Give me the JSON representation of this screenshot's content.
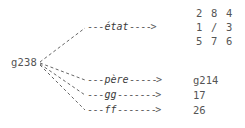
{
  "diagram": {
    "type": "state-node-expansion",
    "background_color": "#ffffff",
    "text_color": "#555555",
    "root_node": {
      "label": "g238",
      "name": "root-node"
    },
    "edges": [
      {
        "id": "etat",
        "label": "état",
        "dash_before": "---",
        "dash_after": "----",
        "arrow_head": ">",
        "target_kind": "grid"
      },
      {
        "id": "pere",
        "label": "père",
        "dash_before": "---",
        "dash_after": "-----",
        "arrow_head": ">",
        "target_kind": "text"
      },
      {
        "id": "gg",
        "label": "gg",
        "dash_before": "---",
        "dash_after": "-------",
        "arrow_head": ">",
        "target_kind": "text"
      },
      {
        "id": "ff",
        "label": "ff",
        "dash_before": "---",
        "dash_after": "-------",
        "arrow_head": ">",
        "target_kind": "text"
      }
    ],
    "values": {
      "etat_grid": {
        "rows": [
          [
            "2",
            "8",
            "4"
          ],
          [
            "1",
            "/",
            "3"
          ],
          [
            "5",
            "7",
            "6"
          ]
        ]
      },
      "pere": "g214",
      "gg": "17",
      "ff": "26"
    }
  }
}
